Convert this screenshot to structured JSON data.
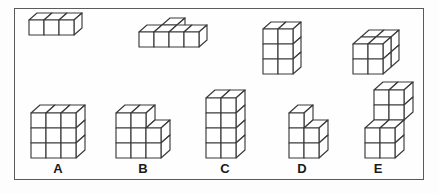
{
  "page": {
    "background_color": "#fdfdfd",
    "frame_border_color": "#5a5a5a",
    "line_color": "#3a3a3a",
    "face_fill_color": "#ffffff",
    "label_color": "#1a1a1a"
  },
  "prompt_row": {
    "name": "prompt-figures",
    "figures": [
      {
        "id": "prompt-1",
        "description": "flat slab of three cubes in a row, one high, one deep",
        "cube_count": 3,
        "cubes": [
          [
            0,
            0,
            0
          ],
          [
            1,
            0,
            0
          ],
          [
            2,
            0,
            0
          ]
        ],
        "origin": {
          "x": 28,
          "y": 34
        },
        "cell": 15,
        "depth_dx": 8,
        "depth_dy": -7
      },
      {
        "id": "prompt-2",
        "description": "L shaped slab: four cubes in a front row with one cube behind the second",
        "cube_count": 5,
        "cubes": [
          [
            0,
            0,
            0
          ],
          [
            1,
            0,
            0
          ],
          [
            2,
            0,
            0
          ],
          [
            3,
            0,
            0
          ],
          [
            1,
            0,
            1
          ]
        ],
        "origin": {
          "x": 138,
          "y": 46
        },
        "cell": 15,
        "depth_dx": 8,
        "depth_dy": -7
      },
      {
        "id": "prompt-3",
        "description": "tower two cubes wide and three cubes tall, one deep",
        "cube_count": 6,
        "cubes": [
          [
            0,
            0,
            0
          ],
          [
            1,
            0,
            0
          ],
          [
            0,
            1,
            0
          ],
          [
            1,
            1,
            0
          ],
          [
            0,
            2,
            0
          ],
          [
            1,
            2,
            0
          ]
        ],
        "origin": {
          "x": 262,
          "y": 73
        },
        "cell": 15,
        "depth_dx": 8,
        "depth_dy": -7
      },
      {
        "id": "prompt-4",
        "description": "solid two by two by two cube",
        "cube_count": 8,
        "cubes": [
          [
            0,
            0,
            0
          ],
          [
            1,
            0,
            0
          ],
          [
            0,
            1,
            0
          ],
          [
            1,
            1,
            0
          ],
          [
            0,
            0,
            1
          ],
          [
            1,
            0,
            1
          ],
          [
            0,
            1,
            1
          ],
          [
            1,
            1,
            1
          ]
        ],
        "origin": {
          "x": 352,
          "y": 73
        },
        "cell": 15,
        "depth_dx": 8,
        "depth_dy": -7
      }
    ]
  },
  "answer_row": {
    "name": "answer-options",
    "options": [
      {
        "label": "A",
        "id": "option-a",
        "description": "solid block three cubes wide and three cubes tall",
        "cube_count": 9,
        "cubes": [
          [
            0,
            0,
            0
          ],
          [
            1,
            0,
            0
          ],
          [
            2,
            0,
            0
          ],
          [
            0,
            1,
            0
          ],
          [
            1,
            1,
            0
          ],
          [
            2,
            1,
            0
          ],
          [
            0,
            2,
            0
          ],
          [
            1,
            2,
            0
          ],
          [
            2,
            2,
            0
          ]
        ],
        "origin": {
          "x": 30,
          "y": 157
        },
        "cell": 15,
        "depth_dx": 9,
        "depth_dy": -8,
        "label_x": 47,
        "label_y": 161
      },
      {
        "label": "B",
        "id": "option-b",
        "description": "stepped block: left two columns three tall, right column two tall",
        "cube_count": 8,
        "cubes": [
          [
            0,
            0,
            0
          ],
          [
            1,
            0,
            0
          ],
          [
            2,
            0,
            0
          ],
          [
            0,
            1,
            0
          ],
          [
            1,
            1,
            0
          ],
          [
            2,
            1,
            0
          ],
          [
            0,
            2,
            0
          ],
          [
            1,
            2,
            0
          ]
        ],
        "origin": {
          "x": 115,
          "y": 157
        },
        "cell": 15,
        "depth_dx": 9,
        "depth_dy": -8,
        "label_x": 132,
        "label_y": 161
      },
      {
        "label": "C",
        "id": "option-c",
        "description": "tower two cubes wide and four cubes tall",
        "cube_count": 8,
        "cubes": [
          [
            0,
            0,
            0
          ],
          [
            1,
            0,
            0
          ],
          [
            0,
            1,
            0
          ],
          [
            1,
            1,
            0
          ],
          [
            0,
            2,
            0
          ],
          [
            1,
            2,
            0
          ],
          [
            0,
            3,
            0
          ],
          [
            1,
            3,
            0
          ]
        ],
        "origin": {
          "x": 205,
          "y": 157
        },
        "cell": 15,
        "depth_dx": 9,
        "depth_dy": -8,
        "label_x": 214,
        "label_y": 161
      },
      {
        "label": "D",
        "id": "option-d",
        "description": "L shape: left column three tall, right column two tall",
        "cube_count": 5,
        "cubes": [
          [
            0,
            0,
            0
          ],
          [
            1,
            0,
            0
          ],
          [
            0,
            1,
            0
          ],
          [
            1,
            1,
            0
          ],
          [
            0,
            2,
            0
          ]
        ],
        "origin": {
          "x": 288,
          "y": 157
        },
        "cell": 15,
        "depth_dx": 9,
        "depth_dy": -8,
        "label_x": 291,
        "label_y": 161
      },
      {
        "label": "E",
        "id": "option-e",
        "description": "stepped block: lower two by two front block with a two by two block set back above",
        "cube_count": 8,
        "cubes": [
          [
            0,
            0,
            0
          ],
          [
            1,
            0,
            0
          ],
          [
            0,
            1,
            0
          ],
          [
            1,
            1,
            0
          ],
          [
            0,
            2,
            1
          ],
          [
            1,
            2,
            1
          ],
          [
            0,
            3,
            1
          ],
          [
            1,
            3,
            1
          ]
        ],
        "origin": {
          "x": 364,
          "y": 157
        },
        "cell": 15,
        "depth_dx": 9,
        "depth_dy": -8,
        "label_x": 367,
        "label_y": 161
      }
    ]
  }
}
